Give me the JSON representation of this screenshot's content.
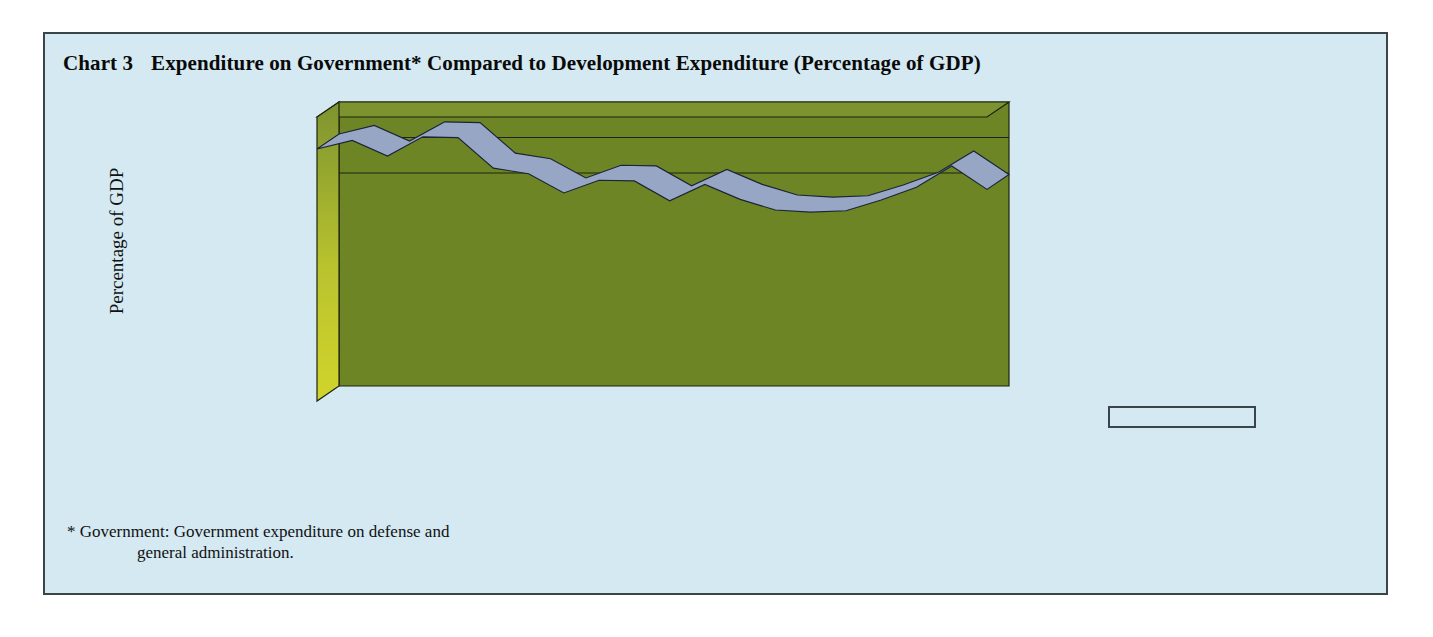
{
  "panel": {
    "background_color": "#d4e9f1",
    "border_color": "#3a4449"
  },
  "header": {
    "chart_number": "Chart 3",
    "title": "Expenditure on Government* Compared to Development Expenditure (Percentage of GDP)"
  },
  "legend": {
    "items": [
      {
        "label": "ADP",
        "color": "#7a3a20"
      },
      {
        "label": "Expenditure on\nGovernment*",
        "color": "#aebad6"
      }
    ]
  },
  "footnote": {
    "line1": "* Government:  Government expenditure on defense and",
    "line2": "general administration."
  },
  "chart_data": {
    "type": "area",
    "stacked": true,
    "three_d": true,
    "title": "Expenditure on Government* Compared to Development Expenditure (Percentage of GDP)",
    "xlabel": "",
    "ylabel": "Percentage of GDP",
    "ylim": [
      0,
      40
    ],
    "yticks": [
      0,
      5,
      10,
      15,
      20,
      25,
      30,
      35,
      40
    ],
    "grid": false,
    "legend_position": "right",
    "back_wall_color": "#6d8524",
    "side_wall_color": "#c3c72f",
    "categories": [
      "1980-1981",
      "1981-1982",
      "1982-1983",
      "1983-1984",
      "1984-1985",
      "1985-1986",
      "1986-1987",
      "1987-1988",
      "1988-1989",
      "1989-1990",
      "1990-1991",
      "1991-1992",
      "1992-1993",
      "1993-1994",
      "1994-1995",
      "1995-1996",
      "1996-1997",
      "1997-1998",
      "1998-1999",
      "1999-2000"
    ],
    "tick_labels_shown": [
      "1980-1981",
      "1982-1983",
      "1984-1985",
      "1986-1987",
      "1988-1989",
      "1990-1991",
      "1992-1993",
      "1994-1995",
      "1996-1997",
      "1998-1999"
    ],
    "series": [
      {
        "name": "ADP",
        "color": "#7a3a20",
        "values": [
          5.6,
          6.2,
          5.2,
          4.6,
          4.8,
          4.2,
          3.6,
          2.4,
          2.1,
          2.1,
          2.0,
          2.5,
          1.9,
          1.6,
          1.4,
          1.2,
          1.1,
          1.0,
          0.9,
          0.7
        ]
      },
      {
        "name": "Expenditure on Government*",
        "color": "#aebad6",
        "values": [
          29.9,
          30.5,
          29.3,
          32.6,
          32.3,
          28.6,
          28.4,
          26.9,
          29.0,
          28.9,
          26.2,
          28.0,
          26.5,
          25.3,
          25.2,
          25.6,
          27.2,
          29.1,
          32.2,
          29.1
        ]
      }
    ],
    "totals": [
      35.5,
      36.7,
      34.5,
      37.2,
      37.1,
      32.8,
      32.0,
      29.3,
      31.1,
      31.0,
      28.2,
      30.5,
      28.4,
      26.9,
      26.6,
      26.8,
      28.3,
      30.1,
      33.1,
      29.8
    ]
  }
}
